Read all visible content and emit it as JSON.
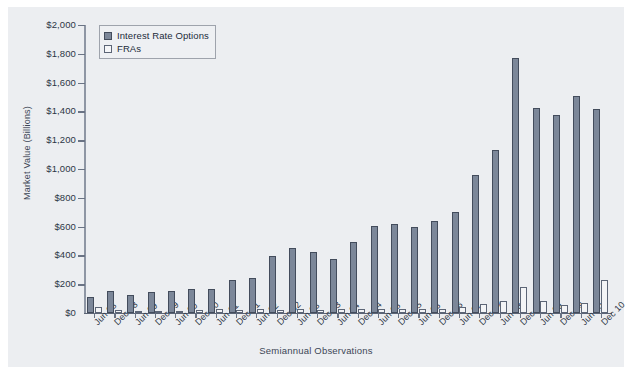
{
  "chart_data": {
    "type": "bar",
    "title": "",
    "xlabel": "Semiannual Observations",
    "ylabel": "Market Value (Billions)",
    "ylim": [
      0,
      2000
    ],
    "yticks": [
      0,
      200,
      400,
      600,
      800,
      1000,
      1200,
      1400,
      1600,
      1800,
      2000
    ],
    "ytick_labels": [
      "$0",
      "$200",
      "$400",
      "$600",
      "$800",
      "$1,000",
      "$1,200",
      "$1,400",
      "$1,600",
      "$1,800",
      "$2,000"
    ],
    "grid": false,
    "legend_position": "upper-left",
    "categories": [
      "Jun 98",
      "Dec 98",
      "Jun 99",
      "Dec 99",
      "Jun 00",
      "Dec 00",
      "Jun 01",
      "Dec 01",
      "Jun 02",
      "Dec 02",
      "Jun 03",
      "Dec 03",
      "Jun 04",
      "Dec 04",
      "Jun 05",
      "Dec 05",
      "Jun 06",
      "Dec 06",
      "Jun 07",
      "Dec 07",
      "Jun 08",
      "Dec 08",
      "Jun 09",
      "Dec 09",
      "Jun 10",
      "Dec 10"
    ],
    "series": [
      {
        "name": "Interest Rate Options",
        "color": "#7c8799",
        "values": [
          110,
          155,
          125,
          145,
          150,
          165,
          170,
          230,
          240,
          395,
          450,
          425,
          375,
          495,
          605,
          615,
          595,
          640,
          700,
          955,
          1135,
          1770,
          1425,
          1375,
          1505,
          1415
        ]
      },
      {
        "name": "FRAs",
        "color": "#f3f4f6",
        "values": [
          45,
          20,
          15,
          12,
          15,
          20,
          25,
          20,
          25,
          20,
          25,
          20,
          25,
          30,
          30,
          25,
          25,
          30,
          40,
          60,
          85,
          180,
          80,
          55,
          70,
          230
        ]
      }
    ]
  },
  "legend": {
    "items": [
      {
        "label": "Interest Rate Options",
        "swatch": "iro"
      },
      {
        "label": "FRAs",
        "swatch": "fra"
      }
    ]
  }
}
